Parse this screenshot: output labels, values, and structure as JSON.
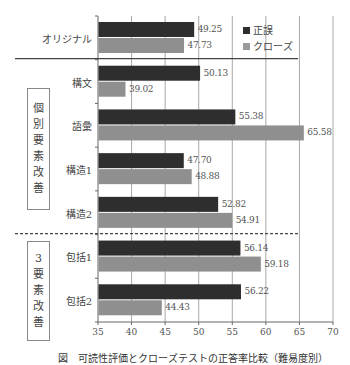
{
  "chart_data": {
    "type": "bar",
    "orientation": "horizontal",
    "title": "",
    "xlabel": "",
    "ylabel": "",
    "xlim": [
      35,
      70
    ],
    "xticks": [
      35,
      40,
      45,
      50,
      55,
      60,
      65,
      70
    ],
    "grid": "vertical",
    "legend_position": "upper right",
    "categories": [
      "オリジナル",
      "構文",
      "語彙",
      "構造1",
      "構造2",
      "包括1",
      "包括2"
    ],
    "series": [
      {
        "name": "正誤",
        "color": "#3a3a3a",
        "values": [
          49.25,
          50.13,
          55.38,
          47.7,
          52.82,
          56.14,
          56.22
        ]
      },
      {
        "name": "クローズ",
        "color": "#8f8f8f",
        "values": [
          47.73,
          39.02,
          65.58,
          48.88,
          54.91,
          59.18,
          44.43
        ]
      }
    ],
    "value_labels": {
      "正誤": [
        "49.25",
        "50.13",
        "55.38",
        "47.70",
        "52.82",
        "56.14",
        "56.22"
      ],
      "クローズ": [
        "47.73",
        "39.02",
        "65.58",
        "48.88",
        "54.91",
        "59.18",
        "44.43"
      ]
    },
    "groups": [
      {
        "label": "個別要素改善",
        "chars": [
          "個",
          "別",
          "要",
          "素",
          "改",
          "善"
        ],
        "categories": [
          "構文",
          "語彙",
          "構造1",
          "構造2"
        ]
      },
      {
        "label": "3要素改善",
        "chars": [
          "3",
          "要",
          "素",
          "改",
          "善"
        ],
        "categories": [
          "包括1",
          "包括2"
        ]
      }
    ],
    "caption": "図　可読性評価とクローズテストの正答率比較（難易度別）"
  },
  "legend": {
    "items": [
      {
        "marker": "■",
        "label": "正誤",
        "color": "#3a3a3a"
      },
      {
        "marker": "■",
        "label": "クローズ",
        "color": "#9a9a9a"
      }
    ]
  }
}
